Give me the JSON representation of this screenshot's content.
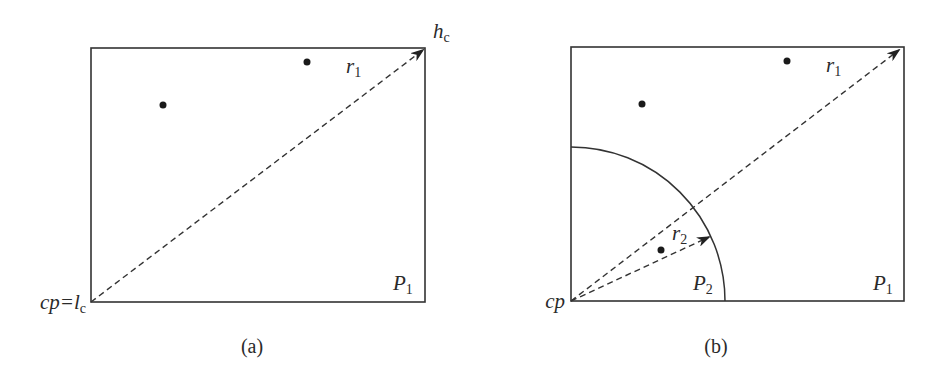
{
  "panel_a": {
    "caption": "(a)",
    "corner_low_label": "cp=l",
    "corner_low_sub": "c",
    "corner_high_label": "h",
    "corner_high_sub": "c",
    "ray_label": "r",
    "ray_sub": "1",
    "partition_label": "P",
    "partition_sub": "1",
    "points": 2
  },
  "panel_b": {
    "caption": "(b)",
    "origin_label": "cp",
    "ray1_label": "r",
    "ray1_sub": "1",
    "ray2_label": "r",
    "ray2_sub": "2",
    "partition1_label": "P",
    "partition1_sub": "1",
    "partition2_label": "P",
    "partition2_sub": "2",
    "points": 3
  },
  "colors": {
    "stroke": "#333333",
    "point": "#1a1a1a",
    "background": "#ffffff"
  }
}
